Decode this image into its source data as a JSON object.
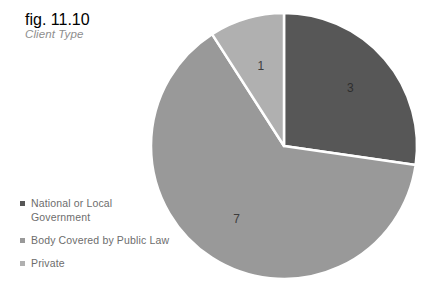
{
  "caption": {
    "figure_number": "fig. 11.10",
    "title": "Client Type"
  },
  "chart_data": {
    "type": "pie",
    "title": "Client Type",
    "subtitle": "fig. 11.10",
    "categories": [
      "National or Local Government",
      "Body Covered by Public Law",
      "Private"
    ],
    "values": [
      3,
      7,
      1
    ],
    "value_labels": [
      "3",
      "7",
      "1"
    ],
    "colors": [
      "#575757",
      "#999999",
      "#b0b0b0"
    ],
    "total": 11,
    "start_angle_deg": 0,
    "direction": "clockwise",
    "legend_position": "bottom-left",
    "grid": false,
    "slice_border_color": "#ffffff",
    "xlabel": "",
    "ylabel": ""
  },
  "legend": {
    "items": [
      {
        "label": "National or Local Government",
        "color": "#575757",
        "value": "3"
      },
      {
        "label": "Body Covered by Public Law",
        "color": "#999999",
        "value": "7"
      },
      {
        "label": "Private",
        "color": "#b0b0b0",
        "value": "1"
      }
    ]
  },
  "colors": {
    "text_muted": "#8e8e8e",
    "legend_text": "#6d6d6d",
    "value_text": "#3d3d3d",
    "background": "#ffffff"
  }
}
